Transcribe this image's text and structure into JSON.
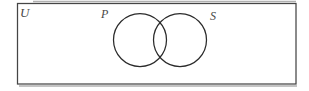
{
  "figure": {
    "type": "venn-diagram",
    "universal_set_label": "U",
    "left_set_label": "P",
    "right_set_label": "S",
    "colors": {
      "background": "#ffffff",
      "rect_stroke": "#454545",
      "circle_stroke": "#2b2b2b",
      "shadow": "#b0b0b0",
      "label_text": "#474747"
    }
  }
}
